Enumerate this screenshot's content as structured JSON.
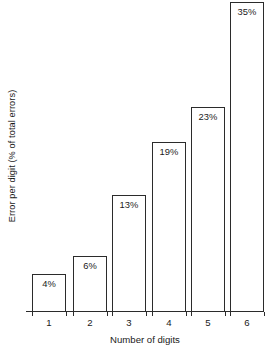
{
  "chart_data": {
    "type": "bar",
    "title": "",
    "subtitle": "",
    "xlabel": "Number of digits",
    "ylabel": "Error per digit (% of total errors)",
    "categories": [
      "1",
      "2",
      "3",
      "4",
      "5",
      "6"
    ],
    "values": [
      4,
      6,
      13,
      19,
      23,
      35
    ],
    "data_labels": [
      "4%",
      "6%",
      "13%",
      "19%",
      "23%",
      "35%"
    ],
    "ylim": [
      0,
      35
    ],
    "xlim": [
      0,
      6
    ],
    "grid": false,
    "legend": null,
    "legend_position": "none",
    "y_tick_labels": [],
    "annotations": [],
    "series": [
      {
        "name": "Error per digit",
        "values": [
          4,
          6,
          13,
          19,
          23,
          35
        ]
      }
    ],
    "style": {
      "bar_fill": "#ffffff",
      "bar_stroke": "#2b2b2b",
      "axis_color": "#2b2b2b",
      "text_color": "#1a1a1a",
      "background": "#ffffff"
    }
  }
}
